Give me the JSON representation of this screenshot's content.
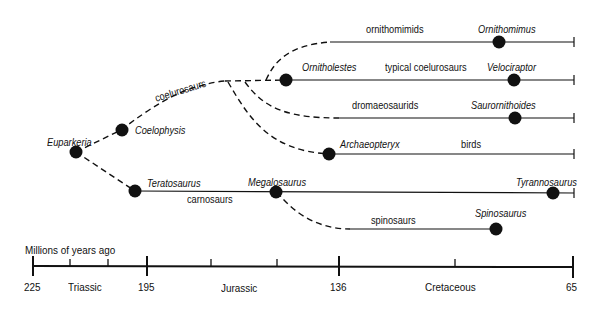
{
  "diagram": {
    "type": "phylogenetic-tree",
    "colors": {
      "ink": "#111111",
      "background": "#ffffff"
    },
    "taxa": [
      {
        "id": "euparkeria",
        "label": "Euparkeria"
      },
      {
        "id": "coelophysis",
        "label": "Coelophysis"
      },
      {
        "id": "teratosaurus",
        "label": "Teratosaurus"
      },
      {
        "id": "megalosaurus",
        "label": "Megalosaurus"
      },
      {
        "id": "ornitholestes",
        "label": "Ornitholestes"
      },
      {
        "id": "archaeopteryx",
        "label": "Archaeopteryx"
      },
      {
        "id": "ornithomimus",
        "label": "Ornithomimus"
      },
      {
        "id": "velociraptor",
        "label": "Velociraptor"
      },
      {
        "id": "saurornithoides",
        "label": "Saurornithoides"
      },
      {
        "id": "tyrannosaurus",
        "label": "Tyrannosaurus"
      },
      {
        "id": "spinosaurus",
        "label": "Spinosaurus"
      }
    ],
    "groups": [
      {
        "id": "coelurosaurs",
        "label": "coelurosaurs"
      },
      {
        "id": "ornithomimids",
        "label": "ornithomimids"
      },
      {
        "id": "typical",
        "label": "typical coelurosaurs"
      },
      {
        "id": "dromaeosaurids",
        "label": "dromaeosaurids"
      },
      {
        "id": "birds",
        "label": "birds"
      },
      {
        "id": "carnosaurs",
        "label": "carnosaurs"
      },
      {
        "id": "spinosaurs",
        "label": "spinosaurs"
      }
    ],
    "timeline": {
      "title": "Millions of years ago",
      "ticks": [
        "225",
        "195",
        "136",
        "65"
      ],
      "periods": [
        "Triassic",
        "Jurassic",
        "Cretaceous"
      ]
    }
  }
}
